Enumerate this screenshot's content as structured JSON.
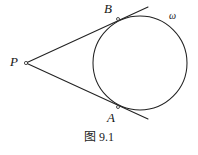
{
  "figure": {
    "caption": "图 9.1",
    "background_color": "#ffffff",
    "stroke_color": "#222222",
    "labels": {
      "external_point": "P",
      "tangency_upper": "B",
      "tangency_lower": "A",
      "circle_name": "ω"
    },
    "geometry": {
      "circle": {
        "cx": 140,
        "cy": 63,
        "r": 47
      },
      "external_point": {
        "x": 26,
        "y": 63
      },
      "tangency_upper": {
        "x": 118,
        "y": 19
      },
      "tangency_lower": {
        "x": 118,
        "y": 107
      },
      "tangent_upper_end": {
        "x": 148,
        "y": 7
      },
      "tangent_lower_end": {
        "x": 148,
        "y": 119
      },
      "point_marker_radius": 1.6
    }
  }
}
